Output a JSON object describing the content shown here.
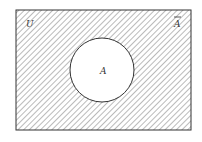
{
  "diagram": {
    "type": "venn",
    "universe_label": "U",
    "set_label": "A",
    "complement_label": "A",
    "shaded_region": "complement of A",
    "colors": {
      "stroke": "#333333",
      "hatch": "#555555",
      "background": "#ffffff"
    }
  }
}
